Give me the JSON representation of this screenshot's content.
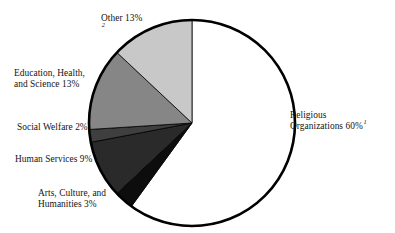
{
  "chart_data": {
    "type": "pie",
    "title": "",
    "subtitle": "",
    "xlabel": "",
    "ylabel": "",
    "legend_position": "none",
    "grid": false,
    "start_angle_deg": 90,
    "direction": "clockwise",
    "categories": [
      "Religious Organizations",
      "Arts, Culture, and Humanities",
      "Human Services",
      "Social Welfare",
      "Education, Health, and Science",
      "Other"
    ],
    "values": [
      60,
      3,
      9,
      2,
      13,
      13
    ],
    "value_unit": "%",
    "colors": [
      "#ffffff",
      "#0d0d0d",
      "#2a2a2a",
      "#3f3f3f",
      "#868686",
      "#c8c8c8"
    ],
    "slices": [
      {
        "name": "Religious Organizations",
        "value": 60,
        "value_text": "60%",
        "color": "#ffffff",
        "footnote_mark": "1",
        "label_lines": [
          "Religious",
          "Organizations 60%"
        ]
      },
      {
        "name": "Arts, Culture, and Humanities",
        "value": 3,
        "value_text": "3%",
        "color": "#0d0d0d",
        "footnote_mark": "",
        "label_lines": [
          "Arts, Culture, and",
          "Humanities 3%"
        ]
      },
      {
        "name": "Human Services",
        "value": 9,
        "value_text": "9%",
        "color": "#2a2a2a",
        "footnote_mark": "",
        "label_lines": [
          "Human Services 9%"
        ]
      },
      {
        "name": "Social Welfare",
        "value": 2,
        "value_text": "2%",
        "color": "#3f3f3f",
        "footnote_mark": "",
        "label_lines": [
          "Social Welfare 2%"
        ]
      },
      {
        "name": "Education, Health, and Science",
        "value": 13,
        "value_text": "13%",
        "color": "#868686",
        "footnote_mark": "",
        "label_lines": [
          "Education, Health,",
          "and Science 13%"
        ]
      },
      {
        "name": "Other",
        "value": 13,
        "value_text": "13%",
        "color": "#c8c8c8",
        "footnote_mark": "2",
        "label_lines": [
          "Other 13%"
        ]
      }
    ]
  },
  "labels": {
    "other": {
      "line1": "Other 13%",
      "mark": "2"
    },
    "education": {
      "line1": "Education, Health,",
      "line2": "and Science 13%"
    },
    "social_welfare": {
      "line1": "Social Welfare 2%"
    },
    "human_services": {
      "line1": "Human Services 9%"
    },
    "arts": {
      "line1": "Arts, Culture, and",
      "line2": "Humanities 3%"
    },
    "religious": {
      "line1": "Religious",
      "line2": "Organizations 60%",
      "mark": "1"
    }
  },
  "style": {
    "outline_color": "#000000",
    "background": "#ffffff"
  }
}
